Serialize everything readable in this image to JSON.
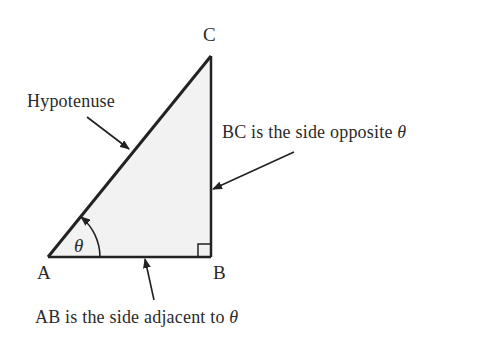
{
  "diagram": {
    "vertices": {
      "A": "A",
      "B": "B",
      "C": "C"
    },
    "angle_symbol": "θ",
    "labels": {
      "hypotenuse": "Hypotenuse",
      "opposite_prefix": "BC is the side opposite ",
      "opposite_symbol": "θ",
      "adjacent_prefix": "AB is the side adjacent to ",
      "adjacent_symbol": "θ"
    },
    "colors": {
      "line": "#222222",
      "fill": "#f2f2f2",
      "text": "#2a2a2a",
      "background": "#ffffff"
    },
    "right_angle_at": "B"
  }
}
